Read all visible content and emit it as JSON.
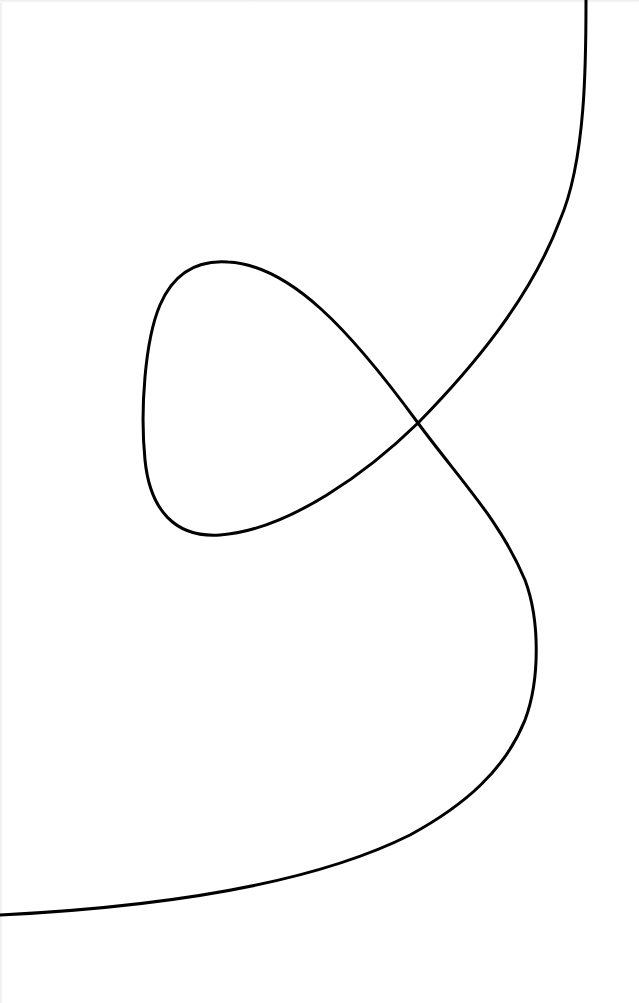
{
  "figure": {
    "type": "single continuous curve with self-intersecting loop",
    "background_color": "#ffffff",
    "stroke_color": "#000000",
    "stroke_width": 3,
    "curve": {
      "start_point": [
        586,
        0
      ],
      "end_point": [
        0,
        915
      ],
      "self_intersection": [
        418,
        423
      ],
      "loop_extremes": {
        "top": [
          225,
          262
        ],
        "left": [
          143,
          420
        ],
        "bottom": [
          215,
          535
        ]
      },
      "right_bulge_extreme": [
        536,
        660
      ]
    }
  }
}
